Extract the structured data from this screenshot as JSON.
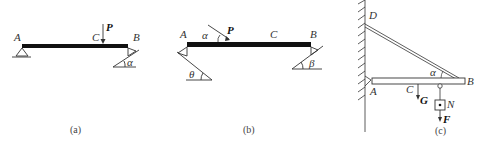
{
  "figures": [
    {
      "caption": "(a)",
      "labels": {
        "A": "A",
        "C": "C",
        "B": "B",
        "P": "P",
        "alpha": "α"
      }
    },
    {
      "caption": "(b)",
      "labels": {
        "A": "A",
        "C": "C",
        "B": "B",
        "P": "P",
        "alpha": "α",
        "theta": "θ",
        "beta": "β"
      }
    },
    {
      "caption": "(c)",
      "labels": {
        "D": "D",
        "A": "A",
        "C": "C",
        "B": "B",
        "G": "G",
        "N": "N",
        "F": "F",
        "alpha": "α"
      }
    }
  ],
  "colors": {
    "beam": "#111111",
    "line": "#333333",
    "text": "#333333"
  }
}
